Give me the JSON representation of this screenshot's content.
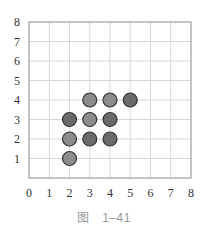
{
  "caption": "图　1–41",
  "chart_data": {
    "type": "scatter",
    "title": "",
    "xlabel": "",
    "ylabel": "",
    "xlim": [
      0,
      8
    ],
    "ylim": [
      0,
      8
    ],
    "grid": true,
    "x_ticks": [
      "0",
      "1",
      "2",
      "3",
      "4",
      "5",
      "6",
      "7",
      "8"
    ],
    "y_ticks": [
      "1",
      "2",
      "3",
      "4",
      "5",
      "6",
      "7",
      "8"
    ],
    "series": [
      {
        "name": "light",
        "color": "#8c8c8c",
        "points": [
          [
            3,
            4
          ],
          [
            4,
            4
          ],
          [
            3,
            3
          ],
          [
            2,
            2
          ],
          [
            2,
            1
          ]
        ]
      },
      {
        "name": "dark",
        "color": "#6a6a6a",
        "points": [
          [
            5,
            4
          ],
          [
            2,
            3
          ],
          [
            4,
            3
          ],
          [
            3,
            2
          ],
          [
            4,
            2
          ]
        ]
      }
    ],
    "marker": {
      "shape": "circle",
      "radius": 7,
      "stroke": "#333333"
    },
    "gridline_color": "#d6d6d6",
    "axis_color": "#8a8a8a"
  }
}
